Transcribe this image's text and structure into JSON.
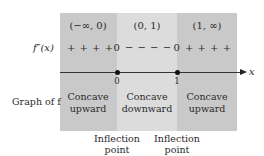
{
  "diagram": {
    "type": "sign-chart",
    "row_labels": {
      "second_derivative": "f″(x)",
      "graph": "Graph of f"
    },
    "axis_label": "x",
    "intervals": [
      {
        "label": "(−∞, 0)",
        "signs": "+ + + +",
        "concavity_line1": "Concave",
        "concavity_line2": "upward",
        "shade": "#c9c9c9"
      },
      {
        "label": "(0, 1)",
        "signs": "− − − −",
        "concavity_line1": "Concave",
        "concavity_line2": "downward",
        "shade": "#dcdcdc"
      },
      {
        "label": "(1, ∞)",
        "signs": "+ + + +",
        "concavity_line1": "Concave",
        "concavity_line2": "upward",
        "shade": "#c9c9c9"
      }
    ],
    "critical_points": [
      {
        "value": "0",
        "sign_value": "0",
        "annotation_line1": "Inflection",
        "annotation_line2": "point"
      },
      {
        "value": "1",
        "sign_value": "0",
        "annotation_line1": "Inflection",
        "annotation_line2": "point"
      }
    ]
  }
}
